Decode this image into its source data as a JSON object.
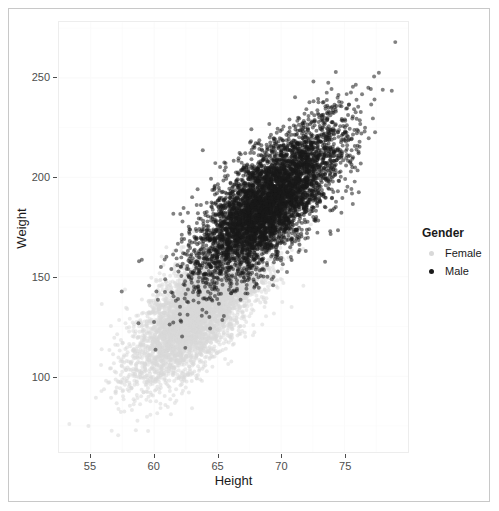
{
  "chart_data": {
    "type": "scatter",
    "title": "",
    "xlabel": "Height",
    "ylabel": "Weight",
    "xlim": [
      52.5,
      80.0
    ],
    "ylim": [
      62,
      278
    ],
    "xticks": [
      55,
      60,
      65,
      70,
      75
    ],
    "yticks": [
      100,
      150,
      200,
      250
    ],
    "grid": true,
    "legend": {
      "title": "Gender",
      "position": "right",
      "entries": [
        {
          "label": "Female",
          "color": "#d9d9d9",
          "key": "female-legend-key"
        },
        {
          "label": "Male",
          "color": "#1a1a1a",
          "key": "male-legend-key"
        }
      ]
    },
    "point_opacity": 0.55,
    "point_size_px": 4,
    "series": [
      {
        "name": "Female",
        "color": "#d9d9d9",
        "n": 5000,
        "x_mean": 63.7,
        "x_sd": 2.65,
        "y_mean": 135.0,
        "y_sd": 19.0,
        "correlation": 0.72
      },
      {
        "name": "Male",
        "color": "#1a1a1a",
        "n": 5000,
        "x_mean": 69.0,
        "x_sd": 2.85,
        "y_mean": 187.0,
        "y_sd": 19.5,
        "correlation": 0.72
      }
    ],
    "annotations": [
      {
        "label": "high-outlier",
        "x": 79.0,
        "y": 268.0,
        "series": "Male"
      }
    ],
    "colors": {
      "panel_background": "#ffffff",
      "panel_border": "#ededed",
      "gridline": "#fafafa",
      "axis_text": "#4d4d4d",
      "title_text": "#1a1a1a",
      "frame_border": "#c8c8c8"
    }
  },
  "axes": {
    "x_tick_labels": [
      "55",
      "60",
      "65",
      "70",
      "75"
    ],
    "y_tick_labels": [
      "250",
      "200",
      "150",
      "100"
    ],
    "x_title": "Height",
    "y_title": "Weight"
  },
  "legend": {
    "title": "Gender",
    "female_label": "Female",
    "male_label": "Male"
  }
}
